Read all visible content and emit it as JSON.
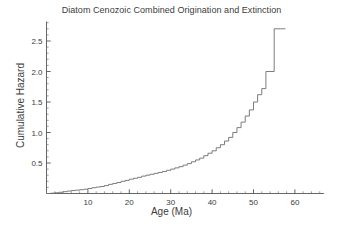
{
  "chart_data": {
    "type": "line",
    "title": "Diatom Cenozoic Combined Origination and Extinction",
    "xlabel": "Age (Ma)",
    "ylabel": "Cumulative Hazard",
    "xlim": [
      0,
      67
    ],
    "ylim": [
      0,
      2.82
    ],
    "grid": false,
    "legend": "none",
    "xticks": [
      10,
      20,
      30,
      40,
      50,
      60
    ],
    "xtick_labels": [
      "10",
      "20",
      "30",
      "40",
      "50",
      "60"
    ],
    "xminor_step": 2,
    "yticks": [
      0.5,
      1.0,
      1.5,
      2.0,
      2.5
    ],
    "ytick_labels": [
      "0.5",
      "1.0",
      "1.5",
      "2.0",
      "2.5"
    ],
    "yminor_step": 0.1,
    "series": [
      {
        "name": "Cumulative Hazard",
        "style": "step-post",
        "color": "#6e6e6e",
        "x": [
          0.0,
          1.0,
          2.0,
          3.0,
          4.0,
          5.0,
          6.0,
          7.0,
          8.0,
          9.0,
          10.0,
          11.0,
          12.0,
          13.0,
          14.0,
          15.0,
          16.0,
          17.0,
          18.0,
          19.0,
          20.0,
          21.0,
          22.0,
          23.0,
          24.0,
          25.0,
          26.0,
          27.0,
          28.0,
          29.0,
          30.0,
          31.0,
          32.0,
          33.0,
          34.0,
          35.0,
          36.0,
          37.0,
          38.0,
          39.0,
          40.0,
          41.0,
          42.0,
          43.0,
          44.0,
          45.0,
          46.0,
          47.0,
          48.0,
          49.0,
          50.0,
          51.0,
          52.0,
          53.0,
          55.0,
          56.5
        ],
        "y": [
          0.0,
          0.005,
          0.012,
          0.02,
          0.03,
          0.04,
          0.048,
          0.055,
          0.062,
          0.07,
          0.082,
          0.095,
          0.105,
          0.115,
          0.13,
          0.15,
          0.165,
          0.18,
          0.2,
          0.215,
          0.235,
          0.25,
          0.265,
          0.285,
          0.3,
          0.315,
          0.33,
          0.345,
          0.36,
          0.38,
          0.4,
          0.42,
          0.44,
          0.465,
          0.49,
          0.52,
          0.55,
          0.58,
          0.62,
          0.66,
          0.7,
          0.75,
          0.8,
          0.86,
          0.92,
          1.0,
          1.08,
          1.17,
          1.27,
          1.37,
          1.5,
          1.62,
          1.72,
          2.0,
          2.7,
          2.7
        ]
      }
    ]
  },
  "axes": {
    "x_axis_name": "x-axis",
    "y_axis_name": "y-axis"
  }
}
